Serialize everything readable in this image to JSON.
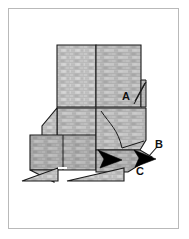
{
  "figure": {
    "frame": {
      "border_color": "#b9b9b9",
      "background_color": "#ffffff",
      "x": 8,
      "y": 8,
      "width": 171,
      "height": 221
    },
    "colors": {
      "texture_light": "#c9c9c9",
      "texture_mid": "#b0b0b0",
      "texture_dark": "#9a9a9a",
      "outline": "#1a1a1a",
      "arrow_fill": "#000000",
      "leader_line": "#1a1a1a",
      "label_text": "#111111",
      "page_background": "#ffffff"
    },
    "labels": [
      {
        "id": "label-a",
        "text": "A",
        "x": 122,
        "y": 91,
        "leader": "diagonal line to upper right flap edge"
      },
      {
        "id": "label-b",
        "text": "B",
        "x": 155,
        "y": 139,
        "leader": "short line down-left to black arrowhead"
      },
      {
        "id": "label-c",
        "text": "C",
        "x": 136,
        "y": 166,
        "leader": "none, sits below right arrowhead"
      }
    ],
    "arrows": [
      {
        "id": "arrow-left",
        "name": "arrowhead-c-region",
        "points_to": "right",
        "tip_x": 118,
        "tip_y": 160
      },
      {
        "id": "arrow-right",
        "name": "arrowhead-b-region",
        "points_to": "right",
        "tip_x": 155,
        "tip_y": 158
      }
    ],
    "structure": {
      "description": "Folded blocky structure with brick-like horizontal band texture, upper pair of rectangular blocks, a middle body, and two triangular foot shapes at the bottom.",
      "parts": [
        "upper-left-block",
        "upper-right-block",
        "right-flap",
        "middle-body",
        "lower-left-block",
        "lower-right-panel",
        "left-foot-triangle",
        "right-foot-triangle"
      ]
    }
  }
}
